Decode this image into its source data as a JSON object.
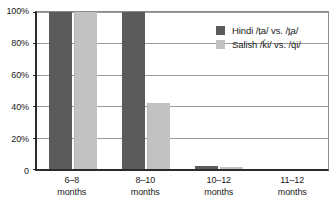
{
  "chart_data": {
    "type": "bar",
    "title": "",
    "subtitle": "",
    "xlabel": "",
    "ylabel": "",
    "categories": [
      "6–8\nmonths",
      "8–10\nmonths",
      "10–12\nmonths",
      "11–12\nmonths"
    ],
    "category_lines": [
      {
        "line1": "6–8",
        "line2": "months"
      },
      {
        "line1": "8–10",
        "line2": "months"
      },
      {
        "line1": "10–12",
        "line2": "months"
      },
      {
        "line1": "11–12",
        "line2": "months"
      }
    ],
    "series": [
      {
        "name": "Hindi /ṭa/ vs. /t̪a/",
        "values": [
          100,
          100,
          2,
          0
        ],
        "color": "#5b5b5b"
      },
      {
        "name": "Salish /ḱi/ vs. /q́i/",
        "values": [
          100,
          42,
          1,
          0
        ],
        "color": "#c2c2c2"
      }
    ],
    "ylim": [
      0,
      100
    ],
    "yticks": [
      0,
      20,
      40,
      60,
      80,
      100
    ],
    "ytick_labels": [
      "0",
      "20%",
      "40%",
      "60%",
      "80%",
      "100%"
    ],
    "grid": true,
    "grid_axis": "y",
    "legend_position": "top-right",
    "units": "percent"
  },
  "legend": {
    "items": [
      {
        "label": "Hindi /ṭa/ vs. /t̪a/",
        "swatch": "dark-gray-swatch"
      },
      {
        "label": "Salish /ḱi/ vs. /q́i/",
        "swatch": "light-gray-swatch"
      }
    ]
  },
  "axes": {
    "y_labels": [
      "100%",
      "80%",
      "60%",
      "40%",
      "20%",
      "0"
    ]
  },
  "colors": {
    "series_hindi": "#5b5b5b",
    "series_salish": "#c2c2c2",
    "axis": "#2b2b2b",
    "gridline": "#9a9a9a",
    "background": "#ffffff",
    "text": "#1a1a1a"
  }
}
